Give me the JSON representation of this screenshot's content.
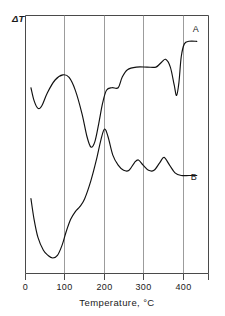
{
  "figure": {
    "title": "",
    "background_color": "#ffffff",
    "width": 225,
    "height": 316
  },
  "axes": {
    "y_label": "ΔT",
    "x_title": "Temperature,  °C",
    "x_ticks": [
      "0",
      "100",
      "200",
      "300",
      "400"
    ],
    "x_tick_values": [
      0,
      100,
      200,
      300,
      400
    ],
    "x_min": 0,
    "x_max": 470,
    "grid": "vertical",
    "frame_color": "#4a4a4a",
    "grid_color": "#8a8a8a"
  },
  "curves": {
    "a_label": "A",
    "b_label": "B"
  },
  "chart_data": {
    "type": "line",
    "title": "",
    "subtitle": "",
    "xlabel": "Temperature,  °C",
    "ylabel": "ΔT",
    "xlim": [
      0,
      470
    ],
    "ylim": [
      0,
      100
    ],
    "grid": true,
    "grid_axis": "x",
    "legend": "inline-right",
    "annotations": [
      {
        "text": "A",
        "x": 435,
        "y": 88
      },
      {
        "text": "B",
        "x": 430,
        "y": 33
      }
    ],
    "series": [
      {
        "name": "A",
        "label_position": "right",
        "points": [
          {
            "x": 14,
            "y": 72
          },
          {
            "x": 22,
            "y": 67
          },
          {
            "x": 32,
            "y": 64
          },
          {
            "x": 42,
            "y": 65
          },
          {
            "x": 56,
            "y": 70
          },
          {
            "x": 76,
            "y": 75
          },
          {
            "x": 96,
            "y": 77
          },
          {
            "x": 112,
            "y": 76
          },
          {
            "x": 128,
            "y": 71
          },
          {
            "x": 145,
            "y": 62
          },
          {
            "x": 158,
            "y": 53
          },
          {
            "x": 168,
            "y": 49
          },
          {
            "x": 178,
            "y": 51
          },
          {
            "x": 188,
            "y": 58
          },
          {
            "x": 198,
            "y": 66
          },
          {
            "x": 208,
            "y": 71
          },
          {
            "x": 222,
            "y": 72
          },
          {
            "x": 238,
            "y": 72
          },
          {
            "x": 248,
            "y": 76
          },
          {
            "x": 262,
            "y": 79
          },
          {
            "x": 285,
            "y": 80
          },
          {
            "x": 312,
            "y": 80
          },
          {
            "x": 335,
            "y": 80
          },
          {
            "x": 350,
            "y": 82
          },
          {
            "x": 360,
            "y": 83
          },
          {
            "x": 372,
            "y": 80
          },
          {
            "x": 382,
            "y": 73
          },
          {
            "x": 388,
            "y": 69
          },
          {
            "x": 394,
            "y": 74
          },
          {
            "x": 400,
            "y": 84
          },
          {
            "x": 408,
            "y": 89
          },
          {
            "x": 420,
            "y": 90
          },
          {
            "x": 440,
            "y": 90
          }
        ]
      },
      {
        "name": "B",
        "label_position": "right",
        "points": [
          {
            "x": 14,
            "y": 29
          },
          {
            "x": 22,
            "y": 21
          },
          {
            "x": 32,
            "y": 14
          },
          {
            "x": 46,
            "y": 9
          },
          {
            "x": 58,
            "y": 7
          },
          {
            "x": 70,
            "y": 6
          },
          {
            "x": 82,
            "y": 7
          },
          {
            "x": 94,
            "y": 11
          },
          {
            "x": 104,
            "y": 16
          },
          {
            "x": 116,
            "y": 21
          },
          {
            "x": 128,
            "y": 24
          },
          {
            "x": 140,
            "y": 26
          },
          {
            "x": 152,
            "y": 29
          },
          {
            "x": 168,
            "y": 36
          },
          {
            "x": 182,
            "y": 44
          },
          {
            "x": 194,
            "y": 52
          },
          {
            "x": 203,
            "y": 56
          },
          {
            "x": 212,
            "y": 53
          },
          {
            "x": 224,
            "y": 46
          },
          {
            "x": 238,
            "y": 42
          },
          {
            "x": 252,
            "y": 40
          },
          {
            "x": 266,
            "y": 40
          },
          {
            "x": 280,
            "y": 43
          },
          {
            "x": 290,
            "y": 44
          },
          {
            "x": 302,
            "y": 42
          },
          {
            "x": 316,
            "y": 40
          },
          {
            "x": 330,
            "y": 40
          },
          {
            "x": 345,
            "y": 43
          },
          {
            "x": 356,
            "y": 45
          },
          {
            "x": 370,
            "y": 42
          },
          {
            "x": 384,
            "y": 39
          },
          {
            "x": 400,
            "y": 38
          },
          {
            "x": 420,
            "y": 38
          },
          {
            "x": 440,
            "y": 38
          }
        ]
      }
    ]
  }
}
